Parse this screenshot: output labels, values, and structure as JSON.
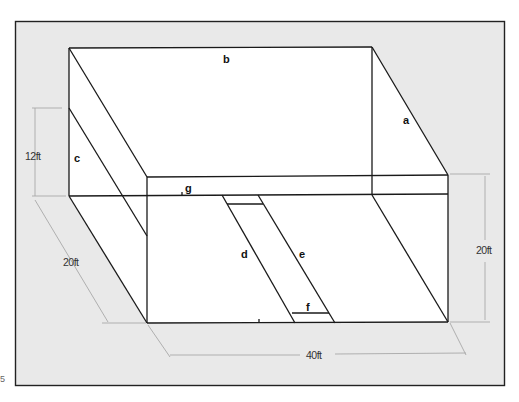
{
  "figure": {
    "type": "room isometric diagram",
    "background_color": "#e9e9e9",
    "frame_color": "#222222",
    "edge_labels": {
      "a": "a",
      "b": "b",
      "c": "c",
      "d": "d",
      "e": "e",
      "f": "f",
      "g": "g"
    },
    "dimensions": {
      "height_left": "12ft",
      "depth": "20ft",
      "width": "40ft",
      "height_right": "20ft"
    },
    "side_mark": "5"
  }
}
